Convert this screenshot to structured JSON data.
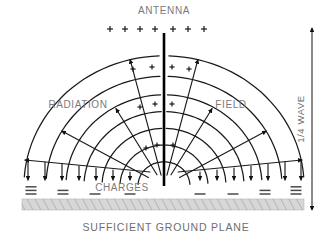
{
  "figure": {
    "labels": {
      "antenna": "ANTENNA",
      "radiation": "RADIATION",
      "field": "FIELD",
      "charges": "CHARGES",
      "ground_plane": "SUFFICIENT GROUND PLANE",
      "quarter_wave": "1/4 WAVE"
    },
    "colors": {
      "line": "#1a1a1a",
      "antenna": "#000000",
      "text": "#7a7a7a",
      "ground_fill": "#d7d7d7",
      "ground_hatch": "#8a8a8a",
      "charge_mark": "#4a4a4a"
    },
    "symbols": {
      "positive": "+",
      "negative": "−"
    },
    "counts": {
      "top_plus_signs": 7,
      "left_down_arrows": 7,
      "right_down_arrows": 7,
      "arcs_per_side": 7,
      "radials_per_side": 6,
      "inner_plus_signs": 10
    }
  },
  "chart_data": {
    "type": "diagram",
    "title": "ANTENNA radiation field",
    "geometry": {
      "antenna_x": 164,
      "antenna_top_y": 33,
      "antenna_base_y": 186,
      "arc_center_x": 164,
      "arc_center_y": 186,
      "arc_radii": [
        26,
        44,
        62,
        80,
        98,
        118,
        140
      ],
      "radial_angles_deg": [
        18,
        36,
        54,
        72,
        90,
        108,
        126,
        144,
        162
      ],
      "ground_plane": {
        "x": 22,
        "y": 199,
        "width": 282,
        "height": 11
      },
      "dimension_arrow": {
        "x": 312,
        "y_top": 28,
        "y_bottom": 210,
        "label": "1/4 WAVE"
      }
    },
    "annotations": [
      {
        "text": "ANTENNA",
        "x": 164,
        "y": 14,
        "anchor": "middle"
      },
      {
        "text": "RADIATION",
        "x": 78,
        "y": 108,
        "anchor": "middle"
      },
      {
        "text": "FIELD",
        "x": 231,
        "y": 108,
        "anchor": "middle"
      },
      {
        "text": "CHARGES",
        "x": 122,
        "y": 191,
        "anchor": "middle"
      },
      {
        "text": "SUFFICIENT GROUND PLANE",
        "x": 166,
        "y": 231,
        "anchor": "middle"
      }
    ],
    "charge_groups": [
      {
        "side": "left",
        "x": 31,
        "bars": 3
      },
      {
        "side": "left",
        "x": 63,
        "bars": 2
      },
      {
        "side": "left",
        "x": 95,
        "bars": 1
      },
      {
        "side": "left",
        "x": 130,
        "bars": 1
      },
      {
        "side": "right",
        "x": 200,
        "bars": 1
      },
      {
        "side": "right",
        "x": 233,
        "bars": 1
      },
      {
        "side": "right",
        "x": 265,
        "bars": 2
      },
      {
        "side": "right",
        "x": 296,
        "bars": 3
      }
    ],
    "top_plus_x": [
      110,
      125,
      140,
      155,
      173,
      188,
      204
    ],
    "top_plus_y": 29,
    "inner_plus": [
      {
        "x": 133,
        "y": 69
      },
      {
        "x": 152,
        "y": 67
      },
      {
        "x": 172,
        "y": 67
      },
      {
        "x": 189,
        "y": 69
      },
      {
        "x": 140,
        "y": 107
      },
      {
        "x": 155,
        "y": 104
      },
      {
        "x": 172,
        "y": 104
      },
      {
        "x": 146,
        "y": 148
      },
      {
        "x": 157,
        "y": 145
      },
      {
        "x": 173,
        "y": 145
      }
    ]
  }
}
